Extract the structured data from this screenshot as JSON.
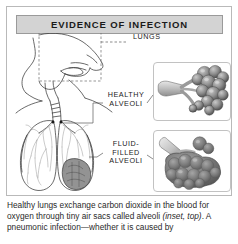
{
  "figure": {
    "title": "EVIDENCE OF INFECTION",
    "labels": {
      "lungs": "LUNGS",
      "healthy_alveoli": "HEALTHY\nALVEOLI",
      "fluid_filled_alveoli": "FLUID-\nFILLED\nALVEOLI"
    },
    "insets": {
      "top": {
        "name": "healthy-alveoli-inset",
        "depicts": "cluster of open grape-like alveolar sacs on a branching bronchiole"
      },
      "bottom": {
        "name": "fluid-filled-alveoli-inset",
        "depicts": "dense merged alveolar sacs congested with fluid"
      }
    },
    "diagram": {
      "name": "human-head-and-lungs-cross-section",
      "elements": [
        "head-and-neck-profile",
        "trachea",
        "left-lung",
        "right-lung",
        "bronchial-tree",
        "infected-shaded-region"
      ]
    },
    "caption": {
      "line1": "Healthy lungs exchange carbon dioxide in the blood",
      "line2_a": "for oxygen through tiny air sacs called alveoli ",
      "line2_em": "(inset,",
      "line3_em": "top)",
      "line3_b": ". A pneumonic infection—whether it is caused by"
    },
    "colors": {
      "banner_fill": "#d3d3d3",
      "banner_border": "#9a9a9a",
      "frame_border": "#b9b9b9",
      "ink": "#231f20",
      "infected_tissue": "#6f6f6f",
      "alveoli_mid": "#8e8e8e",
      "alveoli_dark": "#5d5d5d",
      "page_background": "#ffffff"
    }
  }
}
